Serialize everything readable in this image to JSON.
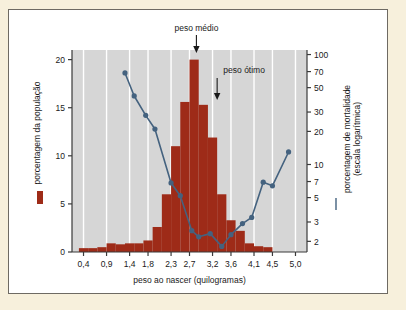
{
  "figure": {
    "background_color": "#f7f0dc",
    "panel_color": "#ffffff",
    "frame_color": "#6e6a63"
  },
  "chart_data": {
    "type": "bar",
    "title": "",
    "subtitle": "",
    "xlabel": "peso ao nascer (quilogramas)",
    "ylabel": "porcentagem da população",
    "y2label": "porcentagem de mortalidade (escala logarítmica)",
    "plot_background": "#d6d6d6",
    "gridlines": "vertical white gridlines at each x tick",
    "grid": true,
    "legend_position": "left-and-right-axis-labels",
    "bar_color": "#9e2b18",
    "line_color": "#44627f",
    "xlim": [
      0.15,
      5.25
    ],
    "ylim": [
      0,
      21
    ],
    "y2lim": [
      1.6,
      110
    ],
    "y2_scale": "log",
    "xticks": [
      "0,4",
      "0,9",
      "1,4",
      "1,8",
      "2,3",
      "2,7",
      "3,2",
      "3,6",
      "4,1",
      "4,5",
      "5,0"
    ],
    "xtick_values": [
      0.4,
      0.9,
      1.4,
      1.8,
      2.3,
      2.7,
      3.2,
      3.6,
      4.1,
      4.5,
      5.0
    ],
    "yticks": [
      "0",
      "5",
      "10",
      "15",
      "20"
    ],
    "ytick_values": [
      0,
      5,
      10,
      15,
      20
    ],
    "y2ticks": [
      "2",
      "3",
      "5",
      "7",
      "10",
      "20",
      "30",
      "50",
      "70",
      "100"
    ],
    "y2tick_values": [
      2,
      3,
      5,
      7,
      10,
      20,
      30,
      50,
      70,
      100
    ],
    "categories": [
      0.4,
      0.6,
      0.8,
      1.0,
      1.2,
      1.4,
      1.6,
      1.8,
      2.0,
      2.2,
      2.4,
      2.6,
      2.8,
      3.0,
      3.2,
      3.4,
      3.6,
      3.8,
      4.0,
      4.2,
      4.4,
      4.6,
      4.8,
      5.0
    ],
    "series": [
      {
        "name": "porcentagem da população",
        "type": "bar",
        "color": "#9e2b18",
        "values": [
          0.4,
          0.4,
          0.5,
          0.9,
          0.8,
          0.9,
          0.9,
          1.2,
          2.6,
          6.0,
          11.0,
          15.6,
          20.0,
          15.3,
          11.9,
          6.0,
          3.3,
          2.2,
          0.9,
          0.6,
          0.5,
          0.0,
          0.0,
          0.0
        ]
      },
      {
        "name": "porcentagem de mortalidade (escala logarítmica)",
        "type": "line-scatter",
        "color": "#44627f",
        "x": [
          1.3,
          1.5,
          1.75,
          1.95,
          2.3,
          2.5,
          2.75,
          2.9,
          3.15,
          3.4,
          3.6,
          3.85,
          4.05,
          4.3,
          4.5,
          4.85
        ],
        "values": [
          68,
          42,
          28,
          21,
          6.8,
          5.2,
          2.5,
          2.2,
          2.35,
          1.8,
          2.3,
          2.9,
          3.3,
          6.9,
          6.4,
          13.0
        ]
      }
    ],
    "annotations": [
      {
        "text": "peso médio",
        "x": 2.85,
        "points_to_x": 2.85,
        "arrow": "down"
      },
      {
        "text": "peso ótimo",
        "x": 3.3,
        "points_to_x": 3.3,
        "arrow": "down"
      }
    ]
  },
  "legend": {
    "population_marker": "red-square",
    "mortality_marker": "blue-line"
  }
}
